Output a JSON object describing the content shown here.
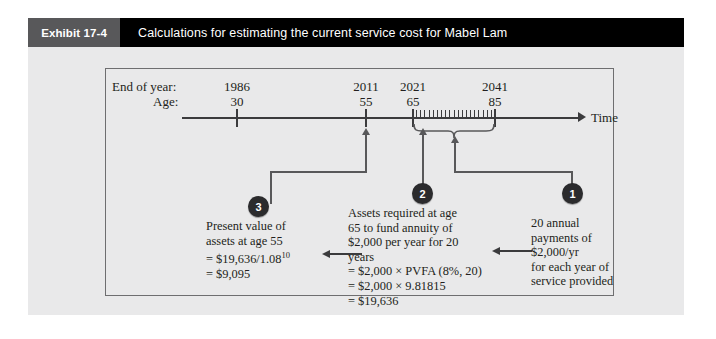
{
  "header": {
    "exhibit_tag": "Exhibit 17-4",
    "title": "Calculations for estimating the current service cost for Mabel Lam"
  },
  "timeline": {
    "row_label_year": "End of year:",
    "row_label_age": "Age:",
    "axis_end_label": "Time",
    "columns": [
      {
        "year": "1986",
        "age": "30"
      },
      {
        "year": "2011",
        "age": "55"
      },
      {
        "year": "2021",
        "age": "65"
      },
      {
        "year": "2041",
        "age": "85"
      }
    ],
    "annual_tick_count": 20
  },
  "badges": {
    "one": "1",
    "two": "2",
    "three": "3"
  },
  "notes": {
    "step3": {
      "line1": "Present value of",
      "line2": "assets at age 55",
      "line3_pre": "= $19,636/1.08",
      "line3_sup": "10",
      "line4": "= $9,095"
    },
    "step2": {
      "line1": "Assets required at age",
      "line2": "65 to fund annuity of",
      "line3": "$2,000 per year for 20",
      "line4": "years",
      "line5": "= $2,000 × PVFA (8%, 20)",
      "line6": "= $2,000 × 9.81815",
      "line7": "= $19,636"
    },
    "step1": {
      "line1": "20 annual",
      "line2": "payments of",
      "line3": " $2,000/yr",
      "line4": "for each year of",
      "line5": "service provided"
    }
  },
  "colors": {
    "header_bar": "#000000",
    "exhibit_tag_bg": "#58585a",
    "panel_bg": "#e9e9ea",
    "badge_bg": "#2b2b2d",
    "line": "#3b3b3d",
    "text": "#231f20"
  }
}
